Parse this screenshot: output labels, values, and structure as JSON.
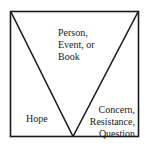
{
  "diagram": {
    "type": "v-shape-in-box",
    "colors": {
      "stroke": "#1a1a1a",
      "background": "#ffffff"
    },
    "labels": {
      "top": {
        "line1": "Person,",
        "line2": "Event, or",
        "line3": "Book"
      },
      "left": {
        "line1": "Hope"
      },
      "right": {
        "line1": "Concern,",
        "line2": "Resistance,",
        "line3": "Question"
      }
    }
  }
}
